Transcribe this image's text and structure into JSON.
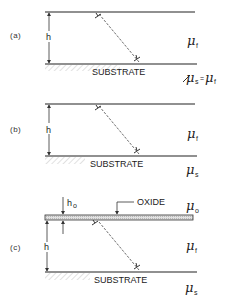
{
  "figure": {
    "panels": [
      {
        "label": "(a)",
        "thickness_label": "h",
        "substrate_label": "SUBSTRATE",
        "film_modulus": {
          "symbol": "μ",
          "subscript": "f"
        },
        "substrate_modulus": {
          "symbol": "μ",
          "subscript": "s",
          "equals": "=",
          "rhs_symbol": "μ",
          "rhs_subscript": "f"
        }
      },
      {
        "label": "(b)",
        "thickness_label": "h",
        "substrate_label": "SUBSTRATE",
        "film_modulus": {
          "symbol": "μ",
          "subscript": "f"
        },
        "substrate_modulus": {
          "symbol": "μ",
          "subscript": "s"
        }
      },
      {
        "label": "(c)",
        "thickness_label": "h",
        "oxide_thickness_label": "h",
        "oxide_thickness_subscript": "o",
        "oxide_label": "OXIDE",
        "substrate_label": "SUBSTRATE",
        "oxide_modulus": {
          "symbol": "μ",
          "subscript": "o"
        },
        "film_modulus": {
          "symbol": "μ",
          "subscript": "f"
        },
        "substrate_modulus": {
          "symbol": "μ",
          "subscript": "s"
        }
      }
    ]
  },
  "colors": {
    "line": "#222222",
    "hatch": "#bbbbbb",
    "oxide_fill": "#d4d4d4"
  }
}
